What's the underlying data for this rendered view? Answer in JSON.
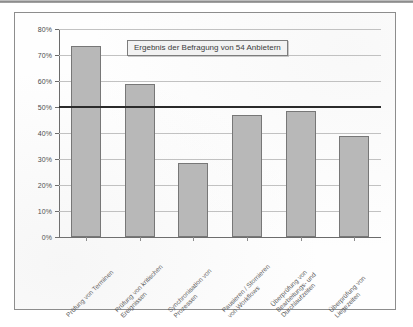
{
  "chart_data": {
    "type": "bar",
    "title": "Ergebnis der Befragung von 54 Anbietern",
    "xlabel": "",
    "ylabel": "",
    "ylim": [
      0,
      80
    ],
    "grid": true,
    "legend": "none",
    "categories": [
      "Prüfung von Terminen",
      "Prüfung von kritischen Ereignissen",
      "Synchronisation von Prozessen",
      "Pausieren / Stornieren von Workflows",
      "Überprüfung von Bearbeitungs- und Durchlaufzeiten",
      "Überprüfung von Liegezeiten"
    ],
    "category_lines": [
      [
        "Prüfung von Terminen"
      ],
      [
        "Prüfung von kritischen",
        "Ereignissen"
      ],
      [
        "Synchronisation von",
        "Prozessen"
      ],
      [
        "Pausieren / Stornieren",
        "von Workflows"
      ],
      [
        "Überprüfung von",
        "Bearbeitungs- und",
        "Durchlaufzeiten"
      ],
      [
        "Überprüfung von",
        "Liegezeiten"
      ]
    ],
    "values": [
      73.5,
      59.0,
      28.5,
      47.0,
      48.5,
      39.0
    ],
    "ytick_labels": [
      "0%",
      "10%",
      "20%",
      "30%",
      "40%",
      "50%",
      "60%",
      "70%",
      "80%"
    ],
    "ytick_values": [
      0,
      10,
      20,
      30,
      40,
      50,
      60,
      70,
      80
    ],
    "reference_line": {
      "value": 50,
      "label": ""
    },
    "colors": {
      "bar_fill": "#b8b8b8",
      "bar_border": "#777777",
      "gridline": "#c2c2c2",
      "axis": "#6b6b6b",
      "reference_line": "#2b2b2b",
      "frame": "#8d8d8d",
      "background": "#fefefe",
      "text": "#4a4a4a"
    }
  }
}
